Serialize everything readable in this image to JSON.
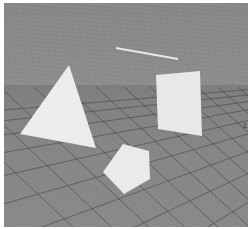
{
  "scene": {
    "title": "3D perspective grid scene",
    "background_color": "#8c8c8c",
    "ground_color": "#868686",
    "grid_line_color": "#4a4a4a",
    "shape_fill_color": "#e9e9e9",
    "horizon_y": 84
  },
  "axis": {
    "z_label": "z"
  },
  "objects": [
    {
      "name": "triangle",
      "label": "white triangle",
      "fill": "#ececec",
      "points": "65,62 16,131 92,145"
    },
    {
      "name": "square",
      "label": "white square panel",
      "fill": "#e8e8e8",
      "points": "152,72 196,68 198,133 154,126"
    },
    {
      "name": "pentagon",
      "label": "white pentagon",
      "fill": "#eaeaea",
      "points": "119,141 145,148 146,176 120,191 99,169"
    },
    {
      "name": "sliver",
      "label": "thin white sliver",
      "fill": "#f2f2f2",
      "points": "112,44 174,55 174,57 112,46"
    }
  ],
  "grid": {
    "description": "perspective diamond grid floor",
    "line_color": "#484848",
    "line_width": 1,
    "rows": 11,
    "columns": 13
  }
}
